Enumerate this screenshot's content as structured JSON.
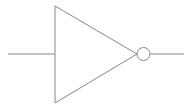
{
  "diagram": {
    "type": "logic-gate",
    "gate": "NOT",
    "stroke_color": "#888888",
    "background": "#ffffff",
    "input_line": {
      "x1": 8,
      "y1": 54,
      "x2": 55,
      "y2": 54
    },
    "triangle": {
      "points": "55,6 55,103 137,54"
    },
    "bubble": {
      "cx": 143.5,
      "cy": 54,
      "r": 6.5
    },
    "output_line": {
      "x1": 150,
      "y1": 54,
      "x2": 184,
      "y2": 54
    }
  }
}
